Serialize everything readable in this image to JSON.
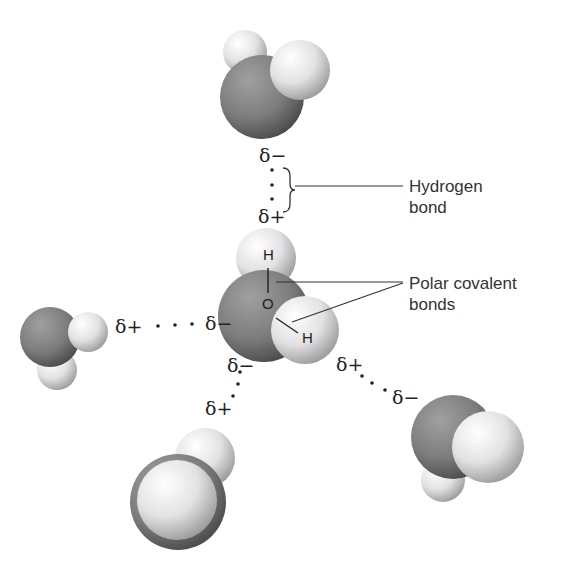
{
  "callouts": {
    "hydrogen_bond": [
      "Hydrogen",
      "bond"
    ],
    "polar_covalent": [
      "Polar covalent",
      "bonds"
    ]
  },
  "central_molecule": {
    "atoms": {
      "h_top": "H",
      "oxygen": "O",
      "h_bottom": "H"
    }
  },
  "partial_charges": {
    "top_minus": "δ−",
    "top_plus": "δ+",
    "left_plus": "δ+",
    "left_minus": "δ−",
    "bottom_minus": "δ−",
    "bottom_plus": "δ+",
    "right_plus": "δ+",
    "right_minus": "δ−"
  },
  "colors": {
    "oxygen": "#7a7a7a",
    "hydrogen": "#e6e6e6",
    "text": "#333333",
    "line": "#333333"
  }
}
